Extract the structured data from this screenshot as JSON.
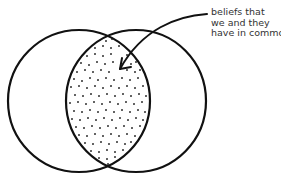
{
  "diagram": {
    "colors": {
      "stroke": "#111111",
      "dots": "#222222",
      "text": "#333333",
      "background": "#ffffff"
    },
    "circles": [
      {
        "name": "left-circle",
        "cx": 79,
        "cy": 101,
        "rx": 71,
        "ry": 71
      },
      {
        "name": "right-circle",
        "cx": 136,
        "cy": 101,
        "rx": 70,
        "ry": 71
      }
    ],
    "annotation": {
      "lines": [
        "beliefs that",
        "we and they",
        "have in common"
      ],
      "arrow": {
        "from": [
          207,
          14
        ],
        "to": [
          120,
          69
        ]
      }
    },
    "stipple_dots": [
      [
        106,
        41
      ],
      [
        112,
        39
      ],
      [
        95,
        48
      ],
      [
        103,
        46
      ],
      [
        111,
        48
      ],
      [
        119,
        46
      ],
      [
        87,
        56
      ],
      [
        95,
        54
      ],
      [
        103,
        56
      ],
      [
        111,
        54
      ],
      [
        127,
        55
      ],
      [
        81,
        63
      ],
      [
        89,
        65
      ],
      [
        97,
        62
      ],
      [
        105,
        64
      ],
      [
        113,
        62
      ],
      [
        131,
        64
      ],
      [
        136,
        62
      ],
      [
        77,
        72
      ],
      [
        85,
        70
      ],
      [
        93,
        72
      ],
      [
        101,
        70
      ],
      [
        109,
        72
      ],
      [
        127,
        70
      ],
      [
        135,
        72
      ],
      [
        140,
        70
      ],
      [
        74,
        79
      ],
      [
        82,
        81
      ],
      [
        90,
        78
      ],
      [
        98,
        80
      ],
      [
        106,
        78
      ],
      [
        114,
        80
      ],
      [
        122,
        78
      ],
      [
        130,
        80
      ],
      [
        138,
        78
      ],
      [
        71,
        87
      ],
      [
        79,
        86
      ],
      [
        87,
        88
      ],
      [
        95,
        86
      ],
      [
        103,
        88
      ],
      [
        111,
        86
      ],
      [
        119,
        88
      ],
      [
        127,
        86
      ],
      [
        135,
        88
      ],
      [
        143,
        86
      ],
      [
        75,
        95
      ],
      [
        83,
        96
      ],
      [
        91,
        94
      ],
      [
        99,
        96
      ],
      [
        107,
        94
      ],
      [
        115,
        96
      ],
      [
        123,
        94
      ],
      [
        131,
        96
      ],
      [
        139,
        94
      ],
      [
        146,
        96
      ],
      [
        70,
        103
      ],
      [
        78,
        102
      ],
      [
        86,
        104
      ],
      [
        94,
        102
      ],
      [
        102,
        104
      ],
      [
        110,
        102
      ],
      [
        118,
        104
      ],
      [
        126,
        102
      ],
      [
        134,
        104
      ],
      [
        142,
        102
      ],
      [
        74,
        111
      ],
      [
        82,
        112
      ],
      [
        90,
        110
      ],
      [
        98,
        112
      ],
      [
        106,
        110
      ],
      [
        114,
        112
      ],
      [
        122,
        110
      ],
      [
        130,
        112
      ],
      [
        138,
        110
      ],
      [
        145,
        112
      ],
      [
        72,
        119
      ],
      [
        80,
        120
      ],
      [
        88,
        118
      ],
      [
        96,
        120
      ],
      [
        104,
        118
      ],
      [
        112,
        120
      ],
      [
        120,
        118
      ],
      [
        128,
        120
      ],
      [
        136,
        118
      ],
      [
        143,
        120
      ],
      [
        76,
        127
      ],
      [
        84,
        128
      ],
      [
        92,
        126
      ],
      [
        100,
        128
      ],
      [
        108,
        126
      ],
      [
        116,
        128
      ],
      [
        124,
        126
      ],
      [
        132,
        128
      ],
      [
        140,
        126
      ],
      [
        79,
        135
      ],
      [
        87,
        136
      ],
      [
        95,
        134
      ],
      [
        103,
        136
      ],
      [
        111,
        134
      ],
      [
        119,
        136
      ],
      [
        127,
        134
      ],
      [
        135,
        136
      ],
      [
        85,
        143
      ],
      [
        93,
        144
      ],
      [
        101,
        142
      ],
      [
        109,
        144
      ],
      [
        117,
        142
      ],
      [
        125,
        144
      ],
      [
        131,
        142
      ],
      [
        91,
        151
      ],
      [
        99,
        152
      ],
      [
        107,
        150
      ],
      [
        115,
        152
      ],
      [
        123,
        150
      ],
      [
        99,
        158
      ],
      [
        107,
        159
      ],
      [
        115,
        157
      ],
      [
        108,
        164
      ]
    ]
  }
}
